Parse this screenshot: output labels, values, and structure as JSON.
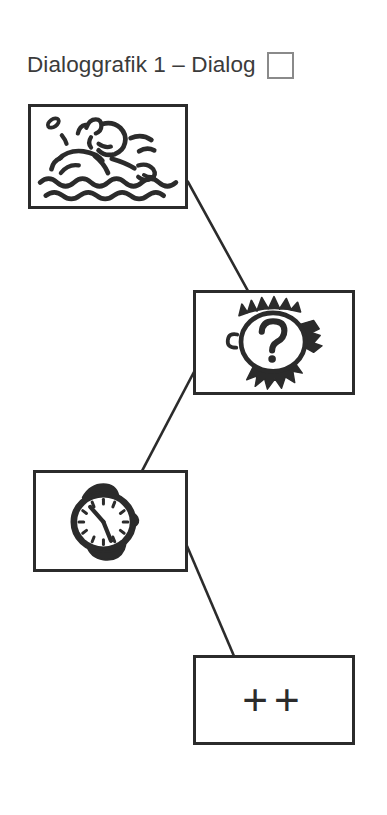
{
  "header": {
    "title": "Dialoggrafik 1 – Dialog",
    "checkbox_checked": false,
    "checkbox_name": "dialog-checkbox"
  },
  "colors": {
    "ink": "#2b2b2b",
    "title_text": "#3b3b3b",
    "checkbox_border": "#8a8a8a",
    "background": "#ffffff"
  },
  "sequence": {
    "cards": [
      {
        "index": 1,
        "icon": "swimmer-in-water-icon",
        "caption": "",
        "x": 28,
        "y": 104,
        "width": 160,
        "height": 105
      },
      {
        "index": 2,
        "icon": "head-with-question-mark-icon",
        "caption": "?",
        "x": 193,
        "y": 290,
        "width": 162,
        "height": 105
      },
      {
        "index": 3,
        "icon": "wristwatch-clock-icon",
        "caption": "",
        "x": 33,
        "y": 470,
        "width": 155,
        "height": 102
      },
      {
        "index": 4,
        "icon": "plus-plus-symbol",
        "caption": "++",
        "x": 193,
        "y": 655,
        "width": 162,
        "height": 90
      }
    ],
    "connectors": [
      {
        "from": 1,
        "to": 2,
        "x1": 188,
        "y1": 182,
        "x2": 247,
        "y2": 290
      },
      {
        "from": 2,
        "to": 3,
        "x1": 193,
        "y1": 372,
        "x2": 142,
        "y2": 470
      },
      {
        "from": 3,
        "to": 4,
        "x1": 188,
        "y1": 545,
        "x2": 233,
        "y2": 655
      }
    ]
  }
}
